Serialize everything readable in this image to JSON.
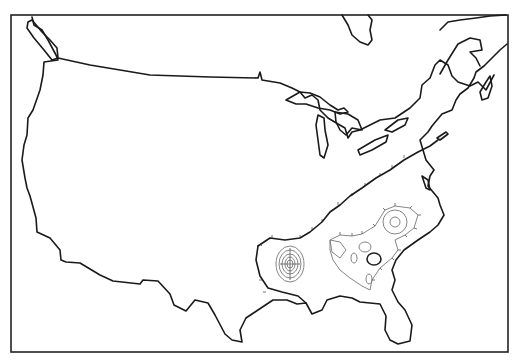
{
  "map": {
    "subject": "Contiguous United States outline map with contour overlay",
    "region_highlighted": "Southeastern United States",
    "contour_features": [
      {
        "name": "concentric-contours-louisiana",
        "description": "nested oval contours near southern Louisiana/Mississippi"
      },
      {
        "name": "contour-cluster-carolinas",
        "description": "closed contours over the Carolinas"
      },
      {
        "name": "contour-cluster-georgia",
        "description": "closed contours over Georgia/Alabama"
      },
      {
        "name": "hachured-boundary",
        "description": "tick-marked outer contour bounding the southeastern region"
      }
    ],
    "colors": {
      "coastline": "#1a1a1a",
      "contour": "#777777",
      "background": "#ffffff"
    }
  }
}
